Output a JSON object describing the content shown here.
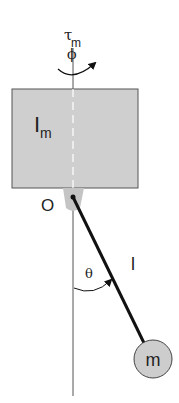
{
  "diagram": {
    "type": "pendulum-on-rotor",
    "colors": {
      "background": "#ffffff",
      "rotor_fill": "#cfcfcf",
      "rotor_stroke": "#555555",
      "mount_fill": "#c4c4c4",
      "mass_fill": "#cdcdcd",
      "rod": "#111111",
      "axis": "#555555",
      "text": "#222222"
    },
    "labels": {
      "torque": "τ",
      "torque_sub": "m",
      "rotor_angle": "ϕ",
      "inertia": "I",
      "inertia_sub": "m",
      "pivot": "O",
      "pendulum_angle": "θ",
      "length": "l",
      "mass": "m"
    }
  }
}
